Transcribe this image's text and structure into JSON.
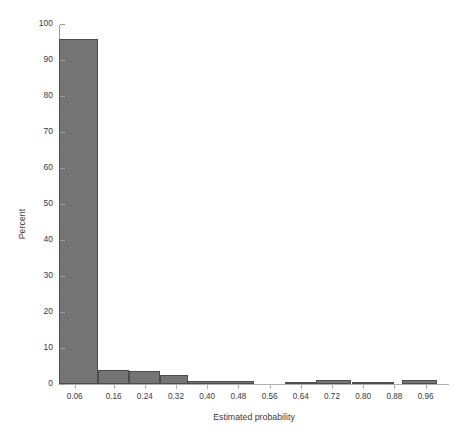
{
  "chart_data": {
    "type": "bar",
    "title": "",
    "subtitle": "",
    "xlabel": "Estimated probability",
    "ylabel": "Percent",
    "grid": false,
    "legend": false,
    "legend_position": "none",
    "xlim": [
      0.02,
      1.02
    ],
    "ylim": [
      0,
      100
    ],
    "bin_width": 0.1,
    "bar_fill_color": "#737373",
    "bar_edge_color": "#4d4d4d",
    "axis_color": "#9a9a9a",
    "background_color": "#ffffff",
    "y_ticks": [
      0,
      10,
      20,
      30,
      40,
      50,
      60,
      70,
      80,
      90,
      100
    ],
    "y_tick_labels": [
      "0",
      "10",
      "20",
      "30",
      "40",
      "50",
      "60",
      "70",
      "80",
      "90",
      "100"
    ],
    "x_ticks": [
      0.06,
      0.16,
      0.24,
      0.32,
      0.4,
      0.48,
      0.56,
      0.64,
      0.72,
      0.8,
      0.88,
      0.96
    ],
    "x_tick_labels": [
      "0.06",
      "0.16",
      "0.24",
      "0.32",
      "0.40",
      "0.48",
      "0.56",
      "0.64",
      "0.72",
      "0.80",
      "0.88",
      "0.96"
    ],
    "bins": [
      {
        "label": "0.02-0.12",
        "x_start": 0.02,
        "x_end": 0.12,
        "value": 95.8
      },
      {
        "label": "0.12-0.20",
        "x_start": 0.12,
        "x_end": 0.2,
        "value": 3.9
      },
      {
        "label": "0.20-0.28",
        "x_start": 0.2,
        "x_end": 0.28,
        "value": 3.6
      },
      {
        "label": "0.28-0.35",
        "x_start": 0.28,
        "x_end": 0.35,
        "value": 2.4
      },
      {
        "label": "0.35-0.52",
        "x_start": 0.35,
        "x_end": 0.52,
        "value": 0.9
      },
      {
        "label": "0.60-0.68",
        "x_start": 0.6,
        "x_end": 0.68,
        "value": 0.6
      },
      {
        "label": "0.68-0.77",
        "x_start": 0.68,
        "x_end": 0.77,
        "value": 1.1
      },
      {
        "label": "0.77-0.88",
        "x_start": 0.77,
        "x_end": 0.88,
        "value": 0.35
      },
      {
        "label": "0.90-0.99",
        "x_start": 0.9,
        "x_end": 0.99,
        "value": 1.1
      }
    ],
    "categories": [
      "0.02-0.12",
      "0.12-0.20",
      "0.20-0.28",
      "0.28-0.35",
      "0.35-0.52",
      "0.60-0.68",
      "0.68-0.77",
      "0.77-0.88",
      "0.90-0.99"
    ],
    "values": [
      95.8,
      3.9,
      3.6,
      2.4,
      0.9,
      0.6,
      1.1,
      0.35,
      1.1
    ]
  }
}
